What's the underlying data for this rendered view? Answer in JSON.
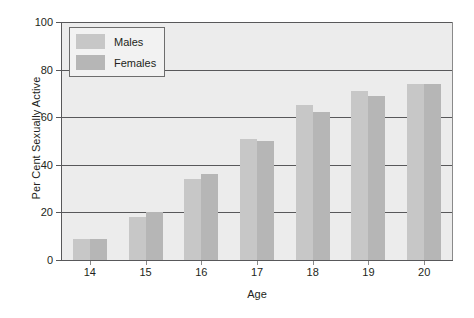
{
  "chart_data": {
    "type": "bar",
    "title": "",
    "xlabel": "Age",
    "ylabel": "Per Cent Sexually Active",
    "categories": [
      "14",
      "15",
      "16",
      "17",
      "18",
      "19",
      "20"
    ],
    "series": [
      {
        "name": "Males",
        "color": "#c7c7c7",
        "values": [
          9,
          18,
          34,
          51,
          65,
          71,
          74
        ]
      },
      {
        "name": "Females",
        "color": "#b6b6b6",
        "values": [
          9,
          20,
          36,
          50,
          62,
          69,
          74
        ]
      }
    ],
    "ylim": [
      0,
      100
    ],
    "yticks": [
      "0",
      "20",
      "40",
      "60",
      "80",
      "100"
    ],
    "ytick_values": [
      0,
      20,
      40,
      60,
      80,
      100
    ],
    "grid": "horizontal",
    "legend_position": "top-left",
    "plot_background": "#ececec",
    "gridline_color": "#58585a"
  },
  "legend": {
    "items": [
      {
        "label": "Males"
      },
      {
        "label": "Females"
      }
    ]
  }
}
